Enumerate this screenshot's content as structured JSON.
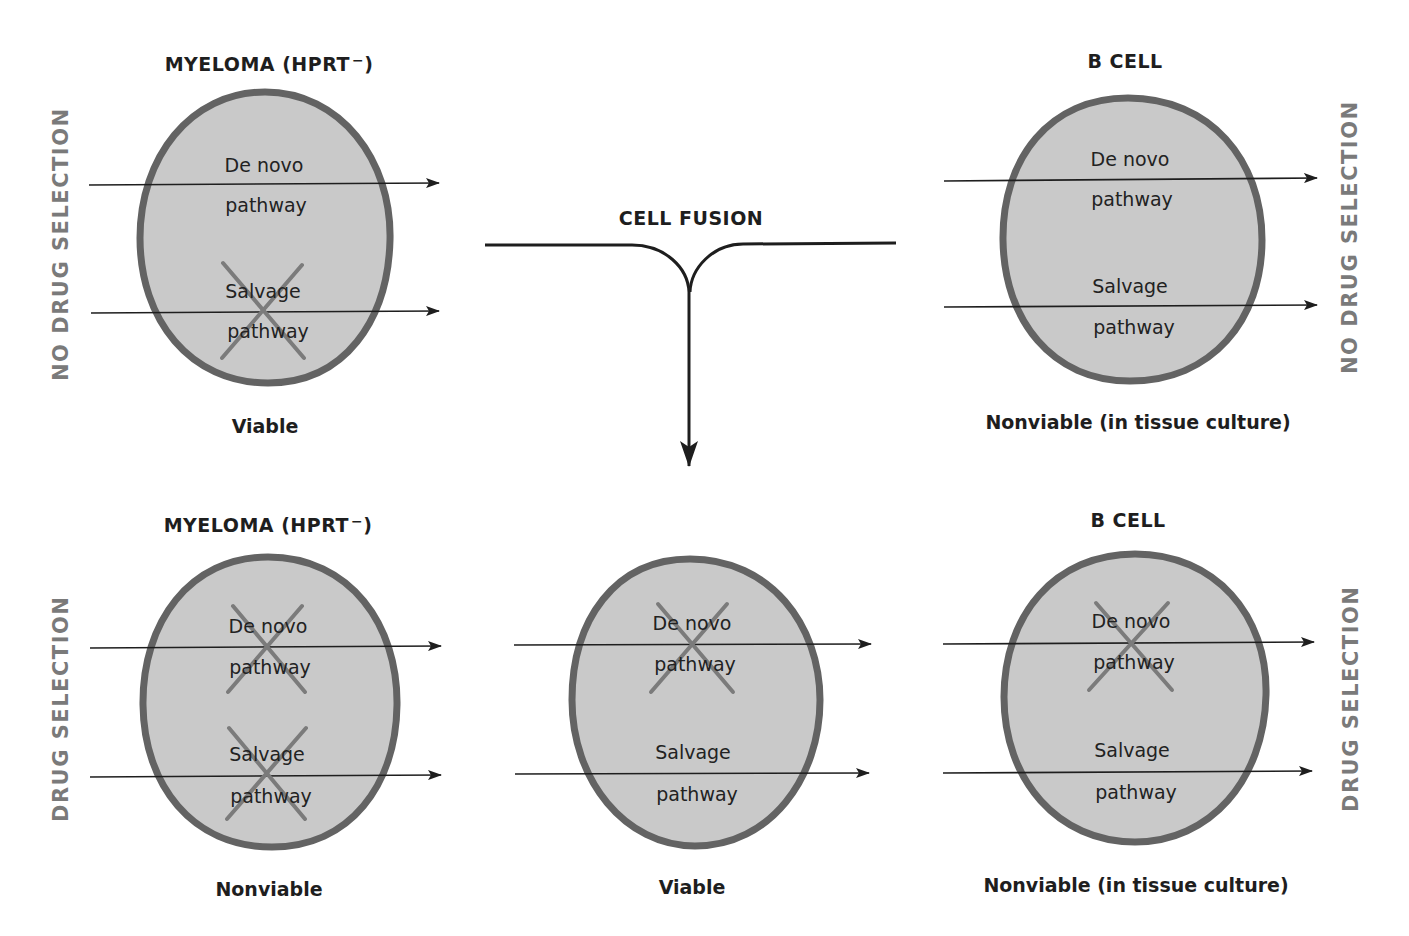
{
  "colors": {
    "cell_fill": "#c9c9c9",
    "cell_outline": "#636363",
    "knockout_x": "#7b7b7b",
    "arrow": "#1e1e1e",
    "side_label": "#7a7a7a",
    "text": "#1e1e1e"
  },
  "side_labels": {
    "top_left": "NO DRUG SELECTION",
    "top_right": "NO DRUG SELECTION",
    "bottom_left": "DRUG SELECTION",
    "bottom_right": "DRUG SELECTION"
  },
  "fusion": {
    "label": "CELL FUSION"
  },
  "pathway_labels": {
    "de_novo_line1": "De novo",
    "de_novo_line2": "pathway",
    "salvage_line1": "Salvage",
    "salvage_line2": "pathway"
  },
  "cells": [
    {
      "id": "top-myeloma",
      "title": "MYELOMA (HPRT",
      "title_sup": "−",
      "title_close": ")",
      "status": "Viable",
      "de_novo_blocked": false,
      "salvage_blocked": true,
      "condition": "No drug selection"
    },
    {
      "id": "top-bcell",
      "title": "B CELL",
      "status": "Nonviable (in tissue culture)",
      "de_novo_blocked": false,
      "salvage_blocked": false,
      "condition": "No drug selection"
    },
    {
      "id": "bottom-myeloma",
      "title": "MYELOMA (HPRT",
      "title_sup": "−",
      "title_close": ")",
      "status": "Nonviable",
      "de_novo_blocked": true,
      "salvage_blocked": true,
      "condition": "Drug selection"
    },
    {
      "id": "bottom-hybrid",
      "title": "",
      "status": "Viable",
      "de_novo_blocked": true,
      "salvage_blocked": false,
      "condition": "Drug selection"
    },
    {
      "id": "bottom-bcell",
      "title": "B CELL",
      "status": "Nonviable (in tissue culture)",
      "de_novo_blocked": true,
      "salvage_blocked": false,
      "condition": "Drug selection"
    }
  ]
}
